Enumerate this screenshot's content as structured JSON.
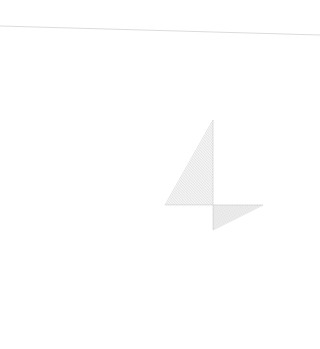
{
  "canvas": {
    "width": 320,
    "height": 349,
    "background": "#ffffff"
  },
  "top_line": {
    "x1": 0,
    "y1": 26,
    "x2": 320,
    "y2": 35,
    "color": "#dcdcdc"
  },
  "string_art": {
    "color": "#9a9a9a",
    "opacity": 0.45,
    "upper_left": {
      "vertical": {
        "x": 213,
        "y_start": 120,
        "y_end": 205
      },
      "horizontal": {
        "y": 205,
        "x_start": 165,
        "x_end": 213
      },
      "line_count": 30
    },
    "lower_right": {
      "vertical": {
        "x": 213,
        "y_start": 205,
        "y_end": 230
      },
      "horizontal": {
        "y": 205,
        "x_start": 213,
        "x_end": 263
      },
      "line_count": 20
    }
  }
}
